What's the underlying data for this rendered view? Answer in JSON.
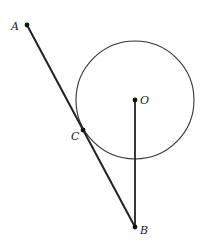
{
  "diagram": {
    "type": "geometry",
    "colors": {
      "stroke": "#222222",
      "background": "#ffffff"
    },
    "circle": {
      "center_label": "O",
      "cx": 135,
      "cy": 100,
      "r": 59
    },
    "points": [
      {
        "label": "A",
        "x": 27,
        "y": 25
      },
      {
        "label": "O",
        "x": 135,
        "y": 100
      },
      {
        "label": "C",
        "x": 83,
        "y": 130
      },
      {
        "label": "B",
        "x": 135,
        "y": 227
      }
    ],
    "segments": [
      {
        "from": "A",
        "to": "B"
      },
      {
        "from": "O",
        "to": "B"
      }
    ],
    "labels": {
      "A": "A",
      "O": "O",
      "C": "C",
      "B": "B"
    }
  }
}
